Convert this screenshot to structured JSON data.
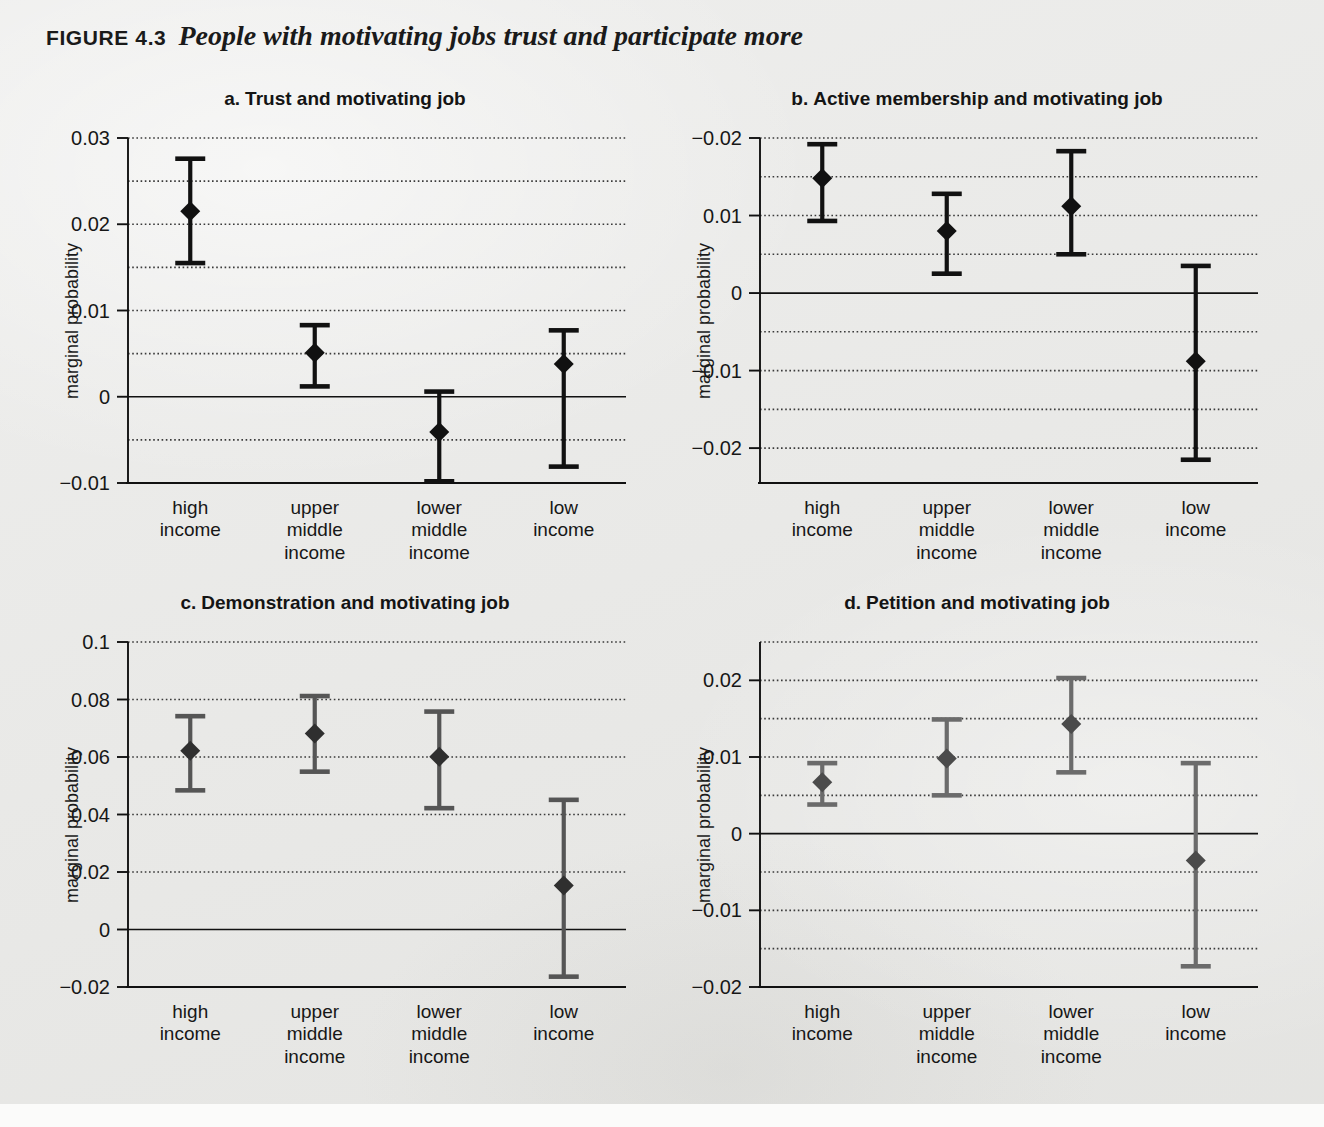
{
  "figure": {
    "number": "FIGURE 4.3",
    "title": "People with motivating jobs trust and participate more"
  },
  "axis": {
    "ylabel": "marginal probability",
    "categories": [
      [
        "high",
        "income"
      ],
      [
        "upper",
        "middle",
        "income"
      ],
      [
        "lower",
        "middle",
        "income"
      ],
      [
        "low",
        "income"
      ]
    ]
  },
  "chart_data": [
    {
      "id": "a",
      "type": "scatter",
      "title": "Trust and motivating job",
      "title_lead": "a.",
      "xlabel": "",
      "ylabel": "marginal probability",
      "categories": [
        "high income",
        "upper middle income",
        "lower middle income",
        "low income"
      ],
      "values": [
        0.0215,
        0.0051,
        -0.0041,
        0.0038
      ],
      "ci_upper": [
        0.0276,
        0.0083,
        0.0006,
        0.0077
      ],
      "ci_lower": [
        0.0155,
        0.0012,
        -0.0098,
        -0.0081
      ],
      "ylim": [
        -0.01,
        0.03
      ],
      "yticks": [
        0.03,
        0.02,
        0.01,
        0,
        -0.01
      ],
      "ytick_labels": [
        "0.03",
        "0.02",
        "0.01",
        "0",
        "−0.01"
      ],
      "gridlines": [
        0.03,
        0.025,
        0.02,
        0.015,
        0.01,
        0.005,
        -0.005
      ],
      "zero_line": 0,
      "grid": true,
      "legend": "none",
      "marker_color": "#111111",
      "error_color": "#111111"
    },
    {
      "id": "b",
      "type": "scatter",
      "title": "Active membership and motivating job",
      "title_lead": "b.",
      "xlabel": "",
      "ylabel": "marginal probability",
      "categories": [
        "high income",
        "upper middle income",
        "lower middle income",
        "low income"
      ],
      "values": [
        0.0148,
        0.008,
        0.0112,
        -0.0088
      ],
      "ci_upper": [
        0.0192,
        0.0128,
        0.0183,
        0.0035
      ],
      "ci_lower": [
        0.0093,
        0.0025,
        0.005,
        -0.0215
      ],
      "ylim": [
        -0.0245,
        0.02
      ],
      "yticks": [
        0.02,
        0.01,
        0,
        -0.01,
        -0.02
      ],
      "ytick_labels": [
        "−0.02",
        "0.01",
        "0",
        "−0.01",
        "−0.02"
      ],
      "gridlines": [
        0.02,
        0.015,
        0.01,
        0.005,
        -0.005,
        -0.01,
        -0.015,
        -0.02
      ],
      "zero_line": 0,
      "grid": true,
      "legend": "none",
      "marker_color": "#111111",
      "error_color": "#111111"
    },
    {
      "id": "c",
      "type": "scatter",
      "title": "Demonstration and motivating job",
      "title_lead": "c.",
      "xlabel": "",
      "ylabel": "marginal probability",
      "categories": [
        "high income",
        "upper middle income",
        "lower middle income",
        "low income"
      ],
      "values": [
        0.0622,
        0.0682,
        0.0601,
        0.0153
      ],
      "ci_upper": [
        0.0742,
        0.0812,
        0.0758,
        0.0451
      ],
      "ci_lower": [
        0.0484,
        0.0549,
        0.0422,
        -0.0164
      ],
      "ylim": [
        -0.02,
        0.1
      ],
      "yticks": [
        0.1,
        0.08,
        0.06,
        0.04,
        0.02,
        0,
        -0.02
      ],
      "ytick_labels": [
        "0.1",
        "0.08",
        "0.06",
        "0.04",
        "0.02",
        "0",
        "−0.02"
      ],
      "gridlines": [
        0.1,
        0.08,
        0.06,
        0.04,
        0.02
      ],
      "zero_line": 0,
      "grid": true,
      "legend": "none",
      "marker_color": "#2f2f2f",
      "error_color": "#555555"
    },
    {
      "id": "d",
      "type": "scatter",
      "title": "Petition and motivating job",
      "title_lead": "d.",
      "xlabel": "",
      "ylabel": "marginal probability",
      "categories": [
        "high income",
        "upper middle income",
        "lower middle income",
        "low income"
      ],
      "values": [
        0.0067,
        0.0098,
        0.0143,
        -0.0035
      ],
      "ci_upper": [
        0.0092,
        0.0149,
        0.0203,
        0.0092
      ],
      "ci_lower": [
        0.0038,
        0.005,
        0.008,
        -0.0173
      ],
      "ylim": [
        -0.02,
        0.025
      ],
      "yticks": [
        0.02,
        0.01,
        0,
        -0.01,
        -0.02
      ],
      "ytick_labels": [
        "0.02",
        "0.01",
        "0",
        "−0.01",
        "−0.02"
      ],
      "gridlines": [
        0.025,
        0.02,
        0.015,
        0.01,
        0.005,
        -0.005,
        -0.01,
        -0.015
      ],
      "zero_line": 0,
      "grid": true,
      "legend": "none",
      "marker_color": "#4b4b4b",
      "error_color": "#6b6b6b"
    }
  ]
}
